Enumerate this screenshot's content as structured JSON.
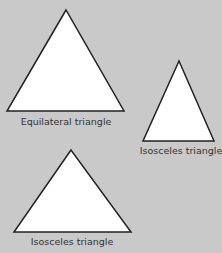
{
  "background": "#c9c9c9",
  "shapes": [
    {
      "type": "triangle",
      "label": "Equilateral triangle",
      "points": [
        [
          66,
          10
        ],
        [
          7,
          111
        ],
        [
          124,
          111
        ]
      ],
      "label_pos": [
        66,
        116
      ]
    },
    {
      "type": "triangle",
      "label": "Isosceles triangle",
      "points": [
        [
          179,
          61
        ],
        [
          143,
          141
        ],
        [
          214,
          141
        ]
      ],
      "label_pos": [
        181,
        145
      ]
    },
    {
      "type": "triangle",
      "label": "Isosceles triangle",
      "points": [
        [
          71,
          150
        ],
        [
          14,
          232
        ],
        [
          131,
          232
        ]
      ],
      "label_pos": [
        72,
        236
      ]
    }
  ],
  "fill": "#ffffff",
  "stroke": "#222222"
}
